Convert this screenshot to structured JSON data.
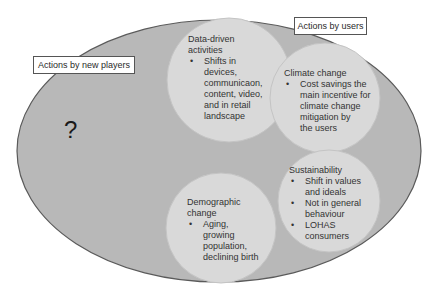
{
  "colors": {
    "outer_fill": "#b8b8b8",
    "outer_stroke": "#5a5a5a",
    "circle_fill": "#d9d9d9",
    "circle_stroke": "#c4c4c4",
    "label_bg": "#ffffff"
  },
  "labels": {
    "new_players": "Actions by new players",
    "users": "Actions by users"
  },
  "question_mark": "?",
  "circles": [
    {
      "id": "data-driven",
      "heading_lines": [
        "Data-driven",
        "activities"
      ],
      "bullets": [
        [
          "Shifts in",
          "devices,",
          "communicaon,",
          "content, video,",
          "and in retail",
          "landscape"
        ]
      ]
    },
    {
      "id": "climate",
      "heading_lines": [
        "Climate change"
      ],
      "bullets": [
        [
          "Cost savings the",
          "main incentive for",
          "climate change",
          "mitigation by",
          "the users"
        ]
      ]
    },
    {
      "id": "sustainability",
      "heading_lines": [
        "Sustainability"
      ],
      "bullets": [
        [
          "Shift in values",
          "and ideals"
        ],
        [
          "Not in general",
          "behaviour"
        ],
        [
          "LOHAS",
          "consumers"
        ]
      ]
    },
    {
      "id": "demographic",
      "heading_lines": [
        "Demographic",
        "change"
      ],
      "bullets": [
        [
          "Aging,",
          "growing",
          "population,",
          "declining birth"
        ]
      ]
    }
  ]
}
